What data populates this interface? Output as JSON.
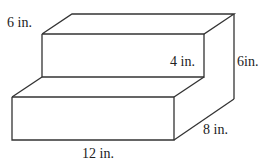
{
  "diagram": {
    "type": "3D stepped solid (two stacked rectangular prisms)",
    "stroke_color": "#333333",
    "labels": {
      "top_depth": "6 in.",
      "step_height": "4 in.",
      "total_height": "6in.",
      "depth": "8 in.",
      "length": "12 in."
    }
  }
}
